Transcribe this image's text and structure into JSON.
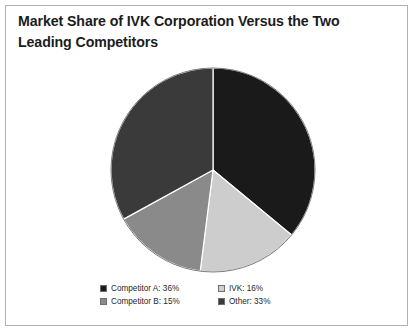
{
  "figure": {
    "background_color": "#ffffff",
    "border_color": "#b0b0b0"
  },
  "title": {
    "line1": "Market Share of IVK Corporation Versus the Two",
    "line2": "Leading Competitors",
    "color": "#1c1c1c"
  },
  "legend": {
    "items": [
      {
        "label": "Competitor A: 36%",
        "color": "#1a1a1a"
      },
      {
        "label": "IVK: 16%",
        "color": "#cdcdcd"
      },
      {
        "label": "Competitor B: 15%",
        "color": "#8a8a8a"
      },
      {
        "label": "Other: 33%",
        "color": "#3a3a3a"
      }
    ]
  },
  "chart_data": {
    "type": "pie",
    "title": "Market Share of IVK Corporation Versus the Two Leading Competitors",
    "xlabel": "",
    "ylabel": "",
    "labels": [
      "Competitor A",
      "IVK",
      "Competitor B",
      "Other"
    ],
    "values": [
      36,
      16,
      15,
      33
    ],
    "value_unit": "percent",
    "colors": [
      "#1a1a1a",
      "#cdcdcd",
      "#8a8a8a",
      "#3a3a3a"
    ],
    "start_angle_deg": 0,
    "direction": "clockwise",
    "legend_position": "bottom",
    "grid": false,
    "slice_order_clockwise_from_top": [
      "Competitor A",
      "IVK",
      "Competitor B",
      "Other"
    ],
    "center_px": [
      103,
      104
    ],
    "radius_px": 102
  }
}
